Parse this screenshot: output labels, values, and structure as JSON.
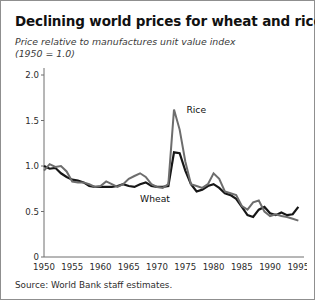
{
  "figure": {
    "title": "Declining world prices for wheat and rice",
    "subtitle_line1": "Price relative to manufactures unit value index",
    "subtitle_line2": "(1950 = 1.0)",
    "source": "Source: World Bank staff estimates.",
    "frame_color": "#8f8f8f",
    "background": "#ffffff"
  },
  "chart_data": {
    "type": "line",
    "title": "Declining world prices for wheat and rice",
    "subtitle": "Price relative to manufactures unit value index (1950 = 1.0)",
    "xlabel": "",
    "ylabel": "",
    "xlim": [
      1950,
      1996
    ],
    "ylim": [
      0,
      2.0
    ],
    "xticks": [
      1950,
      1955,
      1960,
      1965,
      1970,
      1975,
      1980,
      1985,
      1990,
      1995
    ],
    "xticklabels": [
      "1950",
      "1955",
      "1960",
      "1965",
      "1970",
      "1975",
      "1980",
      "1985",
      "1990",
      "1995"
    ],
    "yticks": [
      0,
      0.5,
      1.0,
      1.5,
      2.0
    ],
    "yticklabels": [
      "0",
      "0.5",
      "1.0",
      "1.5",
      "2.0"
    ],
    "grid": false,
    "legend_position": "inline-annotations",
    "annotations": [
      {
        "text": "Rice",
        "x": 1975.2,
        "y": 1.58
      },
      {
        "text": "Wheat",
        "x": 1967.0,
        "y": 0.6
      }
    ],
    "x": [
      1950,
      1951,
      1952,
      1953,
      1954,
      1955,
      1956,
      1957,
      1958,
      1959,
      1960,
      1961,
      1962,
      1963,
      1964,
      1965,
      1966,
      1967,
      1968,
      1969,
      1970,
      1971,
      1972,
      1973,
      1974,
      1975,
      1976,
      1977,
      1978,
      1979,
      1980,
      1981,
      1982,
      1983,
      1984,
      1985,
      1986,
      1987,
      1988,
      1989,
      1990,
      1991,
      1992,
      1993,
      1994,
      1995
    ],
    "series": [
      {
        "name": "Wheat",
        "color": "#161616",
        "width": 2.2,
        "values": [
          1.0,
          0.97,
          0.98,
          0.92,
          0.88,
          0.85,
          0.84,
          0.82,
          0.78,
          0.77,
          0.77,
          0.77,
          0.77,
          0.78,
          0.8,
          0.78,
          0.77,
          0.8,
          0.82,
          0.78,
          0.77,
          0.77,
          0.78,
          1.15,
          1.14,
          0.95,
          0.8,
          0.72,
          0.74,
          0.78,
          0.8,
          0.76,
          0.7,
          0.68,
          0.64,
          0.55,
          0.46,
          0.44,
          0.52,
          0.55,
          0.48,
          0.46,
          0.49,
          0.46,
          0.47,
          0.55
        ]
      },
      {
        "name": "Rice",
        "color": "#6d6d6d",
        "width": 2.0,
        "values": [
          0.95,
          1.02,
          0.99,
          1.0,
          0.94,
          0.83,
          0.82,
          0.82,
          0.8,
          0.77,
          0.78,
          0.83,
          0.8,
          0.77,
          0.8,
          0.86,
          0.89,
          0.92,
          0.88,
          0.8,
          0.77,
          0.76,
          0.8,
          1.62,
          1.4,
          1.05,
          0.8,
          0.78,
          0.76,
          0.8,
          0.92,
          0.86,
          0.72,
          0.7,
          0.68,
          0.56,
          0.52,
          0.6,
          0.62,
          0.5,
          0.45,
          0.47,
          0.45,
          0.44,
          0.42,
          0.4
        ]
      }
    ]
  }
}
